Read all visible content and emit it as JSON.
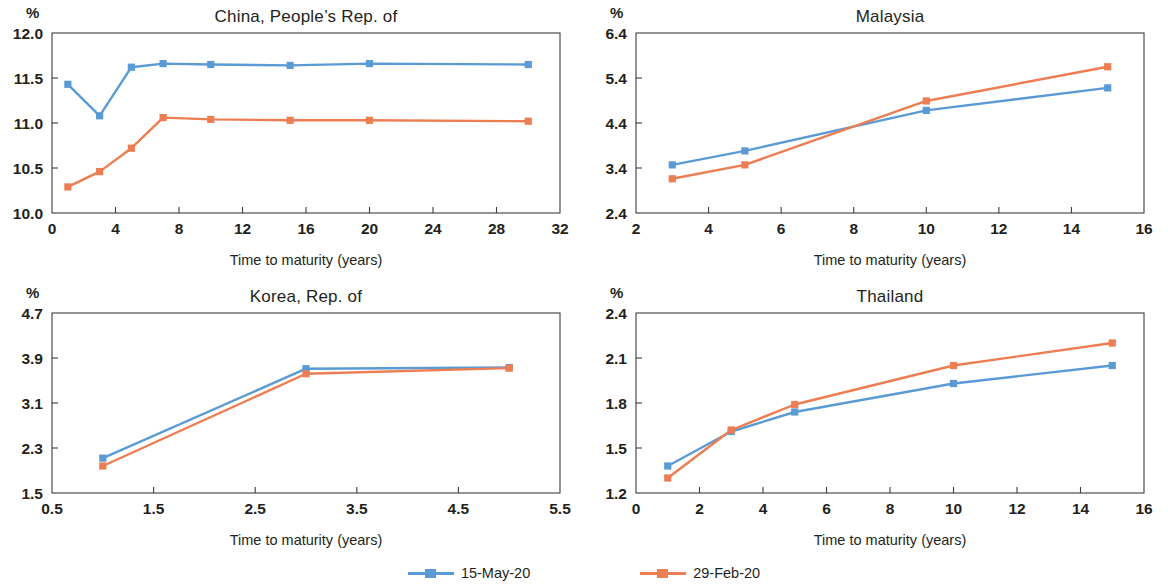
{
  "colors": {
    "series_blue": "#5B9BD5",
    "series_orange": "#ED7D52",
    "axis": "#3c3c3c",
    "text": "#231f20",
    "background": "#ffffff"
  },
  "legend": {
    "position": "bottom-center",
    "items": [
      {
        "label": "15-May-20",
        "color": "#5B9BD5",
        "marker": "square"
      },
      {
        "label": "29-Feb-20",
        "color": "#ED7D52",
        "marker": "square"
      }
    ]
  },
  "common": {
    "unit_label": "%",
    "xlabel": "Time to maturity (years)"
  },
  "chart_data": [
    {
      "id": "china",
      "type": "line",
      "title": "China, People’s Rep. of",
      "xlabel": "Time to maturity (years)",
      "ylabel": "%",
      "xlim": [
        0,
        32
      ],
      "ylim": [
        10.0,
        12.0
      ],
      "xticks": [
        0,
        4,
        8,
        12,
        16,
        20,
        24,
        28,
        32
      ],
      "xticklabels": [
        "0",
        "4",
        "8",
        "12",
        "16",
        "20",
        "24",
        "28",
        "32"
      ],
      "yticks": [
        10.0,
        10.5,
        11.0,
        11.5,
        12.0
      ],
      "yticklabels": [
        "10.0",
        "10.5",
        "11.0",
        "11.5",
        "12.0"
      ],
      "grid": false,
      "x": [
        1,
        3,
        5,
        7,
        10,
        15,
        20,
        30
      ],
      "series": [
        {
          "name": "15-May-20",
          "color": "#5B9BD5",
          "values": [
            11.43,
            11.08,
            11.62,
            11.66,
            11.65,
            11.64,
            11.66,
            11.65
          ]
        },
        {
          "name": "29-Feb-20",
          "color": "#ED7D52",
          "values": [
            10.29,
            10.46,
            10.72,
            11.06,
            11.04,
            11.03,
            11.03,
            11.02
          ]
        }
      ]
    },
    {
      "id": "malaysia",
      "type": "line",
      "title": "Malaysia",
      "xlabel": "Time to maturity (years)",
      "ylabel": "%",
      "xlim": [
        2,
        16
      ],
      "ylim": [
        2.4,
        6.4
      ],
      "xticks": [
        2,
        4,
        6,
        8,
        10,
        12,
        14,
        16
      ],
      "xticklabels": [
        "2",
        "4",
        "6",
        "8",
        "10",
        "12",
        "14",
        "16"
      ],
      "yticks": [
        2.4,
        3.4,
        4.4,
        5.4,
        6.4
      ],
      "yticklabels": [
        "2.4",
        "3.4",
        "4.4",
        "5.4",
        "6.4"
      ],
      "grid": false,
      "x": [
        3,
        5,
        10,
        15
      ],
      "series": [
        {
          "name": "15-May-20",
          "color": "#5B9BD5",
          "values": [
            3.47,
            3.78,
            4.68,
            5.18
          ]
        },
        {
          "name": "29-Feb-20",
          "color": "#ED7D52",
          "values": [
            3.16,
            3.47,
            4.89,
            5.65
          ]
        }
      ]
    },
    {
      "id": "korea",
      "type": "line",
      "title": "Korea, Rep. of",
      "xlabel": "Time to maturity (years)",
      "ylabel": "%",
      "xlim": [
        0.5,
        5.5
      ],
      "ylim": [
        1.5,
        4.7
      ],
      "xticks": [
        0.5,
        1.5,
        2.5,
        3.5,
        4.5,
        5.5
      ],
      "xticklabels": [
        "0.5",
        "1.5",
        "2.5",
        "3.5",
        "4.5",
        "5.5"
      ],
      "yticks": [
        1.5,
        2.3,
        3.1,
        3.9,
        4.7
      ],
      "yticklabels": [
        "1.5",
        "2.3",
        "3.1",
        "3.9",
        "4.7"
      ],
      "grid": false,
      "x": [
        1,
        3,
        5
      ],
      "series": [
        {
          "name": "15-May-20",
          "color": "#5B9BD5",
          "values": [
            2.12,
            3.71,
            3.73
          ]
        },
        {
          "name": "29-Feb-20",
          "color": "#ED7D52",
          "values": [
            1.98,
            3.62,
            3.72
          ]
        }
      ]
    },
    {
      "id": "thailand",
      "type": "line",
      "title": "Thailand",
      "xlabel": "Time to maturity (years)",
      "ylabel": "%",
      "xlim": [
        0,
        16
      ],
      "ylim": [
        1.2,
        2.4
      ],
      "xticks": [
        0,
        2,
        4,
        6,
        8,
        10,
        12,
        14,
        16
      ],
      "xticklabels": [
        "0",
        "2",
        "4",
        "6",
        "8",
        "10",
        "12",
        "14",
        "16"
      ],
      "yticks": [
        1.2,
        1.5,
        1.8,
        2.1,
        2.4
      ],
      "yticklabels": [
        "1.2",
        "1.5",
        "1.8",
        "2.1",
        "2.4"
      ],
      "grid": false,
      "x": [
        1,
        3,
        5,
        10,
        15
      ],
      "series": [
        {
          "name": "15-May-20",
          "color": "#5B9BD5",
          "values": [
            1.38,
            1.61,
            1.74,
            1.93,
            2.05
          ]
        },
        {
          "name": "29-Feb-20",
          "color": "#ED7D52",
          "values": [
            1.3,
            1.62,
            1.79,
            2.05,
            2.2
          ]
        }
      ]
    }
  ]
}
